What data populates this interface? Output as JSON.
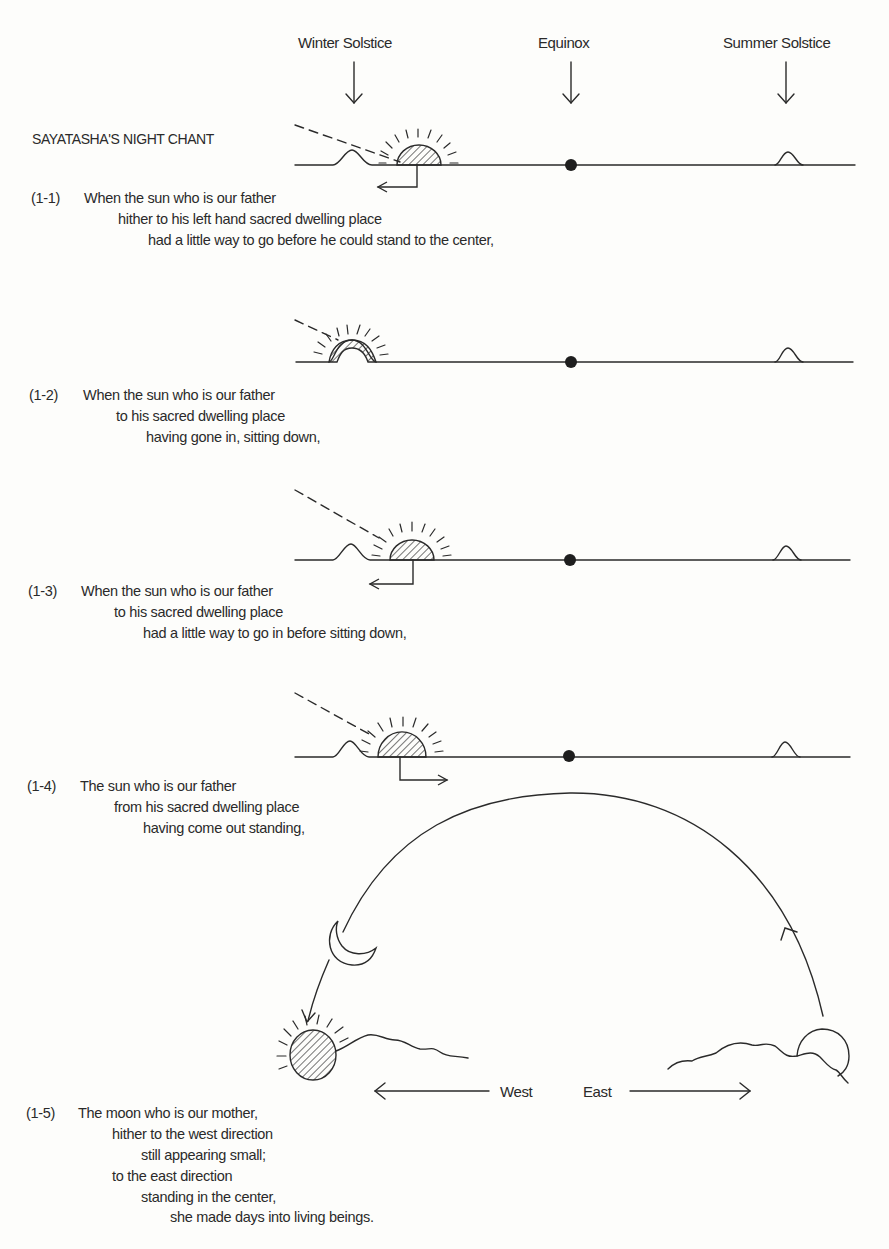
{
  "header": {
    "labels": {
      "winter_solstice": "Winter Solstice",
      "equinox": "Equinox",
      "summer_solstice": "Summer Solstice"
    },
    "title": "SAYATASHA'S NIGHT CHANT"
  },
  "verses": [
    {
      "number": "(1-1)",
      "lines": [
        "When the sun who is our father",
        "hither to his left hand sacred dwelling place",
        "had a little way to go before he could stand to the center,"
      ]
    },
    {
      "number": "(1-2)",
      "lines": [
        "When the sun who is our father",
        "to his sacred dwelling place",
        "having gone in, sitting down,"
      ]
    },
    {
      "number": "(1-3)",
      "lines": [
        "When the sun who is our father",
        "to his sacred dwelling place",
        "had a little way to go in before sitting down,"
      ]
    },
    {
      "number": "(1-4)",
      "lines": [
        "The sun who is our father",
        "from his sacred dwelling place",
        "having come out standing,"
      ]
    },
    {
      "number": "(1-5)",
      "lines": [
        "The moon who is our mother,",
        "hither to the west direction",
        "still appearing small;",
        "to the east direction",
        "standing in the center,",
        "she made days into living beings."
      ]
    }
  ],
  "directions": {
    "west": "West",
    "east": "East"
  },
  "colors": {
    "ink": "#2a2a2a",
    "paper": "#fdfdfb"
  }
}
